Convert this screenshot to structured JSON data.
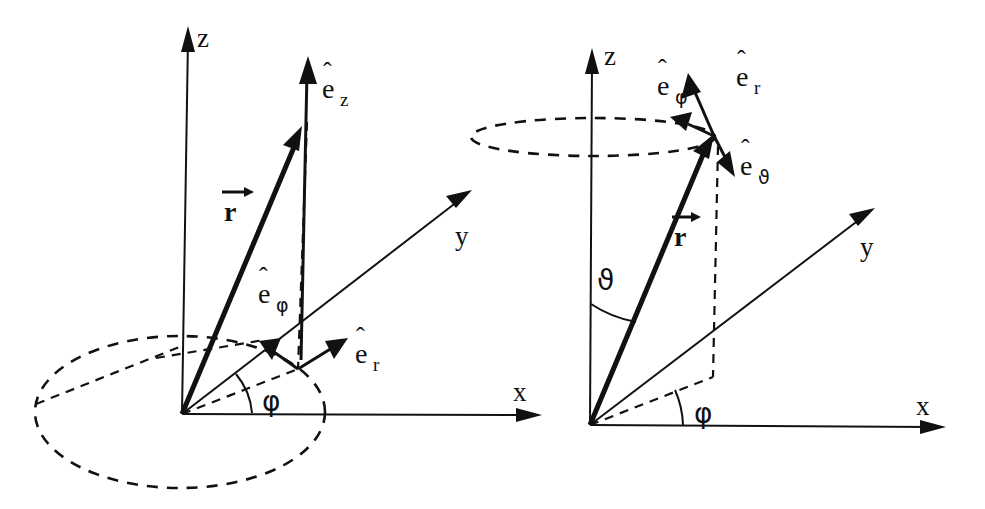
{
  "figure": {
    "background_color": "#ffffff",
    "ink_color": "#111111",
    "width": 985,
    "height": 509
  },
  "diagrams": [
    {
      "id": "cylindrical",
      "name": "cylindrical-coordinates-diagram",
      "axes": {
        "z": "z",
        "y": "y",
        "x": "x"
      },
      "position_vector": "r",
      "angle": "φ",
      "unit_vectors": [
        {
          "id": "e-z",
          "base": "e",
          "hat": "ˆ",
          "sub": "z"
        },
        {
          "id": "e-phi",
          "base": "e",
          "hat": "ˆ",
          "sub": "φ"
        },
        {
          "id": "e-r",
          "base": "e",
          "hat": "ˆ",
          "sub": "r"
        }
      ]
    },
    {
      "id": "spherical",
      "name": "spherical-coordinates-diagram",
      "axes": {
        "z": "z",
        "y": "y",
        "x": "x"
      },
      "position_vector": "r",
      "angles": {
        "polar": "ϑ",
        "azimuthal": "φ"
      },
      "unit_vectors": [
        {
          "id": "e-r",
          "base": "e",
          "hat": "ˆ",
          "sub": "r"
        },
        {
          "id": "e-phi",
          "base": "e",
          "hat": "ˆ",
          "sub": "φ"
        },
        {
          "id": "e-theta",
          "base": "e",
          "hat": "ˆ",
          "sub": "ϑ"
        }
      ]
    }
  ],
  "labels": {
    "left_z_axis": "z",
    "left_y_axis": "y",
    "left_x_axis": "x",
    "left_r_vector": "r",
    "left_phi_angle": "φ",
    "left_ez_base": "e",
    "left_ez_hat": "ˆ",
    "left_ez_sub": "z",
    "left_ephi_base": "e",
    "left_ephi_hat": "ˆ",
    "left_ephi_sub": "φ",
    "left_er_base": "e",
    "left_er_hat": "ˆ",
    "left_er_sub": "r",
    "right_z_axis": "z",
    "right_y_axis": "y",
    "right_x_axis": "x",
    "right_r_vector": "r",
    "right_phi_angle": "φ",
    "right_theta_angle": "ϑ",
    "right_er_base": "e",
    "right_er_hat": "ˆ",
    "right_er_sub": "r",
    "right_ephi_base": "e",
    "right_ephi_hat": "ˆ",
    "right_ephi_sub": "φ",
    "right_etheta_base": "e",
    "right_etheta_hat": "ˆ",
    "right_etheta_sub": "ϑ"
  }
}
